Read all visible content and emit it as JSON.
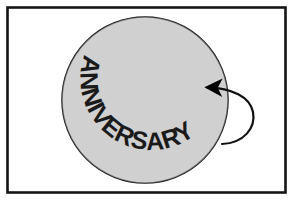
{
  "figure": {
    "name": "anniversary-rotating-disc-illustration",
    "caption_text": "ANNIVERSARY",
    "background_color": "#ffffff"
  },
  "frame": {
    "name": "outer-border-frame",
    "stroke_color": "#141414",
    "fill_color": "#ffffff",
    "stroke_width": 2.6,
    "x": 7.5,
    "y": 7.5,
    "width": 278,
    "height": 185
  },
  "disc": {
    "name": "anniversary-disc",
    "fill_color": "#d9d9d9",
    "stroke_color": "#1a1a1a",
    "stroke_width": 1.6,
    "center_x": 145,
    "center_y": 100,
    "radius": 83
  },
  "curved_text": {
    "name": "anniversary-curved-text",
    "label": "ANNIVERSARY",
    "color": "#1a1a1a",
    "font_size_px": 25,
    "start_offset_percent": "10%",
    "arc_radius": 64
  },
  "rotation_arrow": {
    "name": "rotation-direction-arrow",
    "stroke_color": "#111111",
    "fill_color": "#111111",
    "stroke_width": 2.2,
    "tip_x": 205,
    "tip_y": 87,
    "tail_x": 222,
    "tail_y": 144,
    "loop_extent_x": 254,
    "direction": "counter-clockwise-into-disc"
  },
  "noise": {
    "name": "paper-grain-texture",
    "opacity": 0.055,
    "base_frequency": 0.92
  }
}
